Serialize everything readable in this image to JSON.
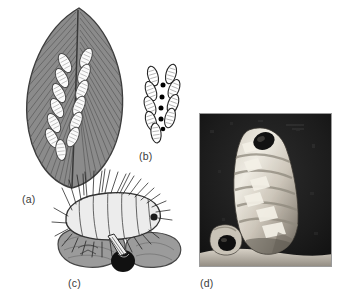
{
  "figure": {
    "type": "scientific-plate",
    "panel_count": 4,
    "background_color": "#ffffff"
  },
  "panels": [
    {
      "id": "a",
      "label": "(a)",
      "label_x": 22,
      "label_y": 193,
      "kind": "line-drawing",
      "subject": "leaf-with-egg-row",
      "colors": {
        "leaf_fill": "#8c8c8c",
        "leaf_vein": "#5e5e5e",
        "leaf_outline": "#3f3f3f",
        "egg_fill": "#fbfbfb",
        "egg_outline": "#4a4a4a"
      },
      "egg_count": 13,
      "arrangement": "herringbone double row along midrib"
    },
    {
      "id": "b",
      "label": "(b)",
      "label_x": 139,
      "label_y": 150,
      "kind": "line-drawing",
      "subject": "egg-cluster-detail",
      "colors": {
        "egg_fill": "#ffffff",
        "egg_outline": "#2b2b2b",
        "dot_fill": "#000000"
      },
      "egg_count": 9,
      "dot_count": 5
    },
    {
      "id": "c",
      "label": "(c)",
      "label_x": 68,
      "label_y": 277,
      "kind": "line-drawing",
      "subject": "bristly-larva-on-leaf",
      "colors": {
        "larva_fill": "#e8e8e8",
        "larva_outline": "#333333",
        "seta": "#222222",
        "leaf_fill": "#9b9b9b",
        "leaf_outline": "#4a4a4a",
        "dark_egg": "#111111"
      },
      "seta_count": 34
    },
    {
      "id": "d",
      "label": "(d)",
      "label_x": 200,
      "label_y": 277,
      "kind": "photograph",
      "subject": "pale-segmented-larva",
      "colors": {
        "frame": "#9a9a9a",
        "background": "#1b1b1b",
        "body_light": "#e2ded5",
        "body_mid": "#b0aaa0",
        "body_shadow": "#6e685f",
        "head_dark": "#141414",
        "substrate": "#cfc9bf"
      },
      "orientation": "upright, head at upper-left"
    }
  ]
}
